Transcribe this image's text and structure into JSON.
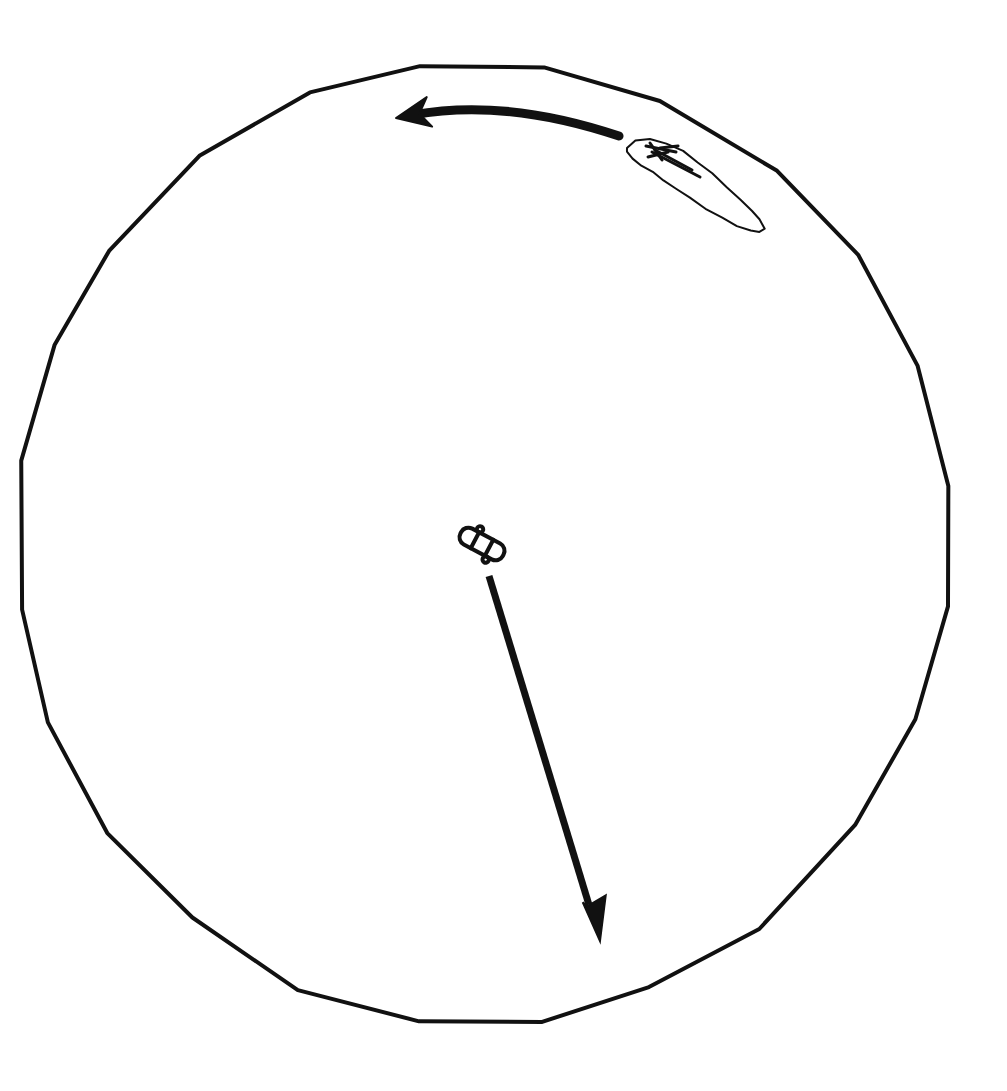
{
  "document": {
    "title": "Hand-drawn circular diagram with rotation arrow, island outline and translation arrow",
    "background_color": "#ffffff",
    "ink_color": "#111111",
    "width": 1007,
    "height": 1091
  },
  "diagram": {
    "kind": "hand-drawn-sketch",
    "elements": [
      {
        "id": "outer-circle",
        "name": "outer-circle-outline",
        "label": "Large hand-drawn circle (polygonal approximation)",
        "stroke_color": "#111111",
        "stroke_width": 4,
        "fill": "none",
        "center": [
          485,
          544
        ],
        "radius_x": 464,
        "radius_y": 478,
        "points": [
          [
            420,
            66
          ],
          [
            545,
            68
          ],
          [
            660,
            101
          ],
          [
            778,
            170
          ],
          [
            858,
            255
          ],
          [
            918,
            365
          ],
          [
            948,
            487
          ],
          [
            948,
            607
          ],
          [
            915,
            720
          ],
          [
            855,
            825
          ],
          [
            760,
            930
          ],
          [
            648,
            986
          ],
          [
            543,
            1022
          ],
          [
            418,
            1022
          ],
          [
            298,
            990
          ],
          [
            192,
            918
          ],
          [
            108,
            832
          ],
          [
            48,
            723
          ],
          [
            22,
            610
          ],
          [
            22,
            460
          ],
          [
            55,
            345
          ],
          [
            110,
            250
          ],
          [
            200,
            155
          ],
          [
            310,
            93
          ]
        ]
      },
      {
        "id": "rotation-arrow",
        "name": "curved-rotation-arrow",
        "label": "Thick curved arrow pointing left (counter-clockwise rotation)",
        "stroke_color": "#111111",
        "stroke_width": 9,
        "tail_point": [
          619,
          136
        ],
        "tip_point": [
          396,
          118
        ],
        "control_point": [
          505,
          98
        ],
        "head_length": 34,
        "head_width": 30,
        "direction": "counter-clockwise"
      },
      {
        "id": "island-outline",
        "name": "island-outline",
        "label": "Elongated leaf / island outline at upper right",
        "stroke_color": "#111111",
        "stroke_width": 2,
        "fill": "none",
        "bounds": [
          618,
          136,
          150,
          100
        ],
        "points": [
          [
            627,
            148
          ],
          [
            636,
            141
          ],
          [
            650,
            139
          ],
          [
            667,
            143
          ],
          [
            683,
            151
          ],
          [
            698,
            162
          ],
          [
            712,
            174
          ],
          [
            727,
            188
          ],
          [
            740,
            200
          ],
          [
            752,
            211
          ],
          [
            760,
            220
          ],
          [
            764,
            228
          ],
          [
            760,
            232
          ],
          [
            750,
            231
          ],
          [
            737,
            226
          ],
          [
            722,
            218
          ],
          [
            706,
            208
          ],
          [
            690,
            198
          ],
          [
            676,
            189
          ],
          [
            664,
            180
          ],
          [
            653,
            172
          ],
          [
            642,
            165
          ],
          [
            633,
            158
          ],
          [
            627,
            152
          ]
        ]
      },
      {
        "id": "island-marks",
        "name": "island-heading-marks",
        "label": "Small dark arrow-like marks on the narrow end of the island outline",
        "stroke_color": "#111111",
        "stroke_width": 3,
        "strokes": [
          [
            [
              646,
              146
            ],
            [
              676,
              152
            ]
          ],
          [
            [
              650,
              143
            ],
            [
              662,
              160
            ]
          ],
          [
            [
              655,
              150
            ],
            [
              692,
              170
            ]
          ],
          [
            [
              648,
              157
            ],
            [
              668,
              152
            ]
          ],
          [
            [
              660,
              148
            ],
            [
              678,
              146
            ]
          ],
          [
            [
              652,
              152
            ],
            [
              700,
              177
            ]
          ]
        ]
      },
      {
        "id": "centre-object",
        "name": "centre-segmented-object",
        "label": "Small segmented capsule object near the centre of the circle",
        "stroke_color": "#111111",
        "stroke_width": 4,
        "fill": "none",
        "center": [
          482,
          544
        ],
        "rotation_degrees": 28,
        "length": 48,
        "width": 18,
        "segments": 3
      },
      {
        "id": "translation-arrow",
        "name": "straight-translation-arrow",
        "label": "Long straight arrow pointing down-right from the centre object",
        "stroke_color": "#111111",
        "stroke_width": 7,
        "tail_point": [
          489,
          576
        ],
        "tip_point": [
          600,
          941
        ],
        "head_length": 42,
        "head_width": 30,
        "direction": "down-right"
      }
    ]
  }
}
